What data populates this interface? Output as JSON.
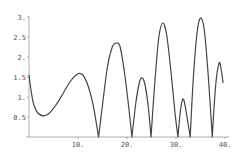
{
  "chart_data": {
    "type": "line",
    "title": "",
    "xlabel": "",
    "ylabel": "",
    "xlim": [
      0,
      40
    ],
    "ylim": [
      0,
      3
    ],
    "grid": false,
    "legend": null,
    "x_ticks": [
      {
        "value": 10,
        "label": "10."
      },
      {
        "value": 20,
        "label": "20."
      },
      {
        "value": 30,
        "label": "30."
      },
      {
        "value": 40,
        "label": "40."
      }
    ],
    "y_ticks": [
      {
        "value": 0.5,
        "label": "0.5"
      },
      {
        "value": 1,
        "label": "1."
      },
      {
        "value": 1.5,
        "label": "1.5"
      },
      {
        "value": 2,
        "label": "2."
      },
      {
        "value": 2.5,
        "label": "2.5"
      },
      {
        "value": 3,
        "label": "3."
      }
    ],
    "series": [
      {
        "name": "curve",
        "color": "#444444",
        "points": [
          [
            0,
            1.55
          ],
          [
            0.5,
            1.1
          ],
          [
            1,
            0.8
          ],
          [
            1.8,
            0.6
          ],
          [
            2.9,
            0.53
          ],
          [
            4,
            0.58
          ],
          [
            5.5,
            0.8
          ],
          [
            7,
            1.1
          ],
          [
            8.5,
            1.4
          ],
          [
            10,
            1.58
          ],
          [
            11,
            1.55
          ],
          [
            12,
            1.3
          ],
          [
            13,
            0.85
          ],
          [
            13.6,
            0.45
          ],
          [
            14.2,
            0
          ],
          [
            15,
            0.8
          ],
          [
            16,
            1.75
          ],
          [
            17,
            2.25
          ],
          [
            17.8,
            2.35
          ],
          [
            18.6,
            2.25
          ],
          [
            19.5,
            1.6
          ],
          [
            20.3,
            0.8
          ],
          [
            21,
            0
          ],
          [
            21.8,
            0.85
          ],
          [
            22.5,
            1.35
          ],
          [
            23,
            1.48
          ],
          [
            23.6,
            1.35
          ],
          [
            24.3,
            0.8
          ],
          [
            24.9,
            0
          ],
          [
            25.7,
            1.4
          ],
          [
            26.5,
            2.5
          ],
          [
            27.3,
            2.85
          ],
          [
            28.1,
            2.55
          ],
          [
            29,
            1.6
          ],
          [
            29.8,
            0.6
          ],
          [
            30.4,
            0
          ],
          [
            30.9,
            0.65
          ],
          [
            31.4,
            0.95
          ],
          [
            31.9,
            0.75
          ],
          [
            32.9,
            0
          ],
          [
            33.6,
            1.6
          ],
          [
            34.4,
            2.7
          ],
          [
            35.1,
            2.97
          ],
          [
            35.8,
            2.65
          ],
          [
            36.6,
            1.5
          ],
          [
            37.4,
            0
          ],
          [
            38.1,
            1.3
          ],
          [
            38.8,
            1.85
          ],
          [
            39.2,
            1.7
          ],
          [
            39.6,
            1.35
          ]
        ]
      }
    ]
  }
}
